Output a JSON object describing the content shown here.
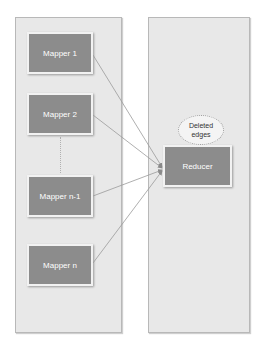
{
  "diagram": {
    "left_panel": {
      "mappers": [
        {
          "label": "Mapper 1"
        },
        {
          "label": "Mapper 2"
        },
        {
          "label": "Mapper n-1"
        },
        {
          "label": "Mapper n"
        }
      ]
    },
    "right_panel": {
      "reducer": {
        "label": "Reducer"
      },
      "annotation": {
        "line1": "Deleted",
        "line2": "edges"
      }
    },
    "colors": {
      "node_fill": "#8c8c8c",
      "panel_fill": "#e8e8e8",
      "edge": "#9a9a9a"
    }
  }
}
